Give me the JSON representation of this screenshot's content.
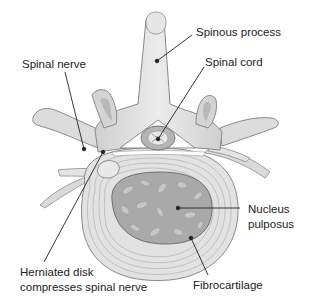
{
  "labels": {
    "spinous_process": "Spinous process",
    "spinal_nerve": "Spinal nerve",
    "spinal_cord": "Spinal cord",
    "nucleus_pulposus_line1": "Nucleus",
    "nucleus_pulposus_line2": "pulposus",
    "herniated_line1": "Herniated disk",
    "herniated_line2": "compresses spinal nerve",
    "fibrocartilage": "Fibrocartilage"
  },
  "colors": {
    "bone": "#d9d9d9",
    "bone_shadow": "#bdbdbd",
    "bone_outline": "#8a8a8a",
    "disk": "#e2e2e2",
    "disk_rings": "#a8a8a8",
    "nucleus": "#a9a9a9",
    "nucleus_blobs": "#c8c8c8",
    "leader_line": "#222222"
  }
}
